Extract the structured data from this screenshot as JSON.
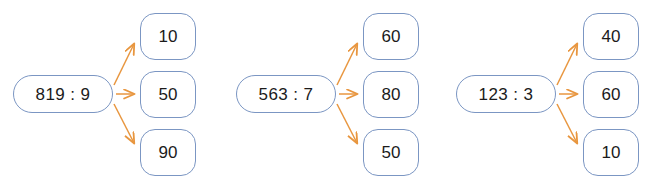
{
  "diagram": {
    "type": "branching-division-diagram",
    "background_color": "#FFFFFF",
    "node_border_color": "#7B96C3",
    "arrow_color": "#E8963F",
    "text_color": "#1B1B1B",
    "groups": [
      {
        "id": "group-1",
        "source": "819 : 9",
        "results": [
          "10",
          "50",
          "90"
        ]
      },
      {
        "id": "group-2",
        "source": "563 : 7",
        "results": [
          "60",
          "80",
          "50"
        ]
      },
      {
        "id": "group-3",
        "source": "123 : 3",
        "results": [
          "40",
          "60",
          "10"
        ]
      }
    ]
  }
}
